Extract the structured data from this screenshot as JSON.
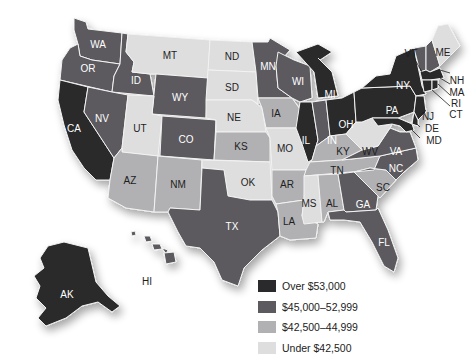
{
  "legend": {
    "items": [
      {
        "label": "Over $53,000",
        "color": "#2a2a2c"
      },
      {
        "label": "$45,000–52,999",
        "color": "#5c5a5e"
      },
      {
        "label": "$42,500–44,999",
        "color": "#b1b1b3"
      },
      {
        "label": "Under $42,500",
        "color": "#dedede"
      }
    ]
  },
  "states": {
    "WA": {
      "label": "WA",
      "tier": 2
    },
    "OR": {
      "label": "OR",
      "tier": 2
    },
    "CA": {
      "label": "CA",
      "tier": 1
    },
    "ID": {
      "label": "ID",
      "tier": 2
    },
    "NV": {
      "label": "NV",
      "tier": 2
    },
    "MT": {
      "label": "MT",
      "tier": 4
    },
    "WY": {
      "label": "WY",
      "tier": 2
    },
    "UT": {
      "label": "UT",
      "tier": 4
    },
    "AZ": {
      "label": "AZ",
      "tier": 3
    },
    "CO": {
      "label": "CO",
      "tier": 2
    },
    "NM": {
      "label": "NM",
      "tier": 3
    },
    "ND": {
      "label": "ND",
      "tier": 4
    },
    "SD": {
      "label": "SD",
      "tier": 4
    },
    "NE": {
      "label": "NE",
      "tier": 4
    },
    "KS": {
      "label": "KS",
      "tier": 3
    },
    "OK": {
      "label": "OK",
      "tier": 4
    },
    "TX": {
      "label": "TX",
      "tier": 2
    },
    "MN": {
      "label": "MN",
      "tier": 2
    },
    "IA": {
      "label": "IA",
      "tier": 3
    },
    "MO": {
      "label": "MO",
      "tier": 4
    },
    "AR": {
      "label": "AR",
      "tier": 3
    },
    "LA": {
      "label": "LA",
      "tier": 3
    },
    "WI": {
      "label": "WI",
      "tier": 2
    },
    "IL": {
      "label": "IL",
      "tier": 1
    },
    "MI": {
      "label": "MI",
      "tier": 1
    },
    "IN": {
      "label": "IN",
      "tier": 2
    },
    "OH": {
      "label": "OH",
      "tier": 1
    },
    "KY": {
      "label": "KY",
      "tier": 3
    },
    "TN": {
      "label": "TN",
      "tier": 3
    },
    "MS": {
      "label": "MS",
      "tier": 4
    },
    "AL": {
      "label": "AL",
      "tier": 3
    },
    "GA": {
      "label": "GA",
      "tier": 2
    },
    "FL": {
      "label": "FL",
      "tier": 2
    },
    "SC": {
      "label": "SC",
      "tier": 3
    },
    "NC": {
      "label": "NC",
      "tier": 2
    },
    "VA": {
      "label": "VA",
      "tier": 2
    },
    "WV": {
      "label": "WV",
      "tier": 4
    },
    "PA": {
      "label": "PA",
      "tier": 1
    },
    "NY": {
      "label": "NY",
      "tier": 1
    },
    "VT": {
      "label": "VT",
      "tier": 2
    },
    "NH": {
      "label": "NH",
      "tier": 2
    },
    "ME": {
      "label": "ME",
      "tier": 4
    },
    "MA": {
      "label": "MA",
      "tier": 1
    },
    "RI": {
      "label": "RI",
      "tier": 1
    },
    "CT": {
      "label": "CT",
      "tier": 1
    },
    "NJ": {
      "label": "NJ",
      "tier": 1
    },
    "DE": {
      "label": "DE",
      "tier": 1
    },
    "MD": {
      "label": "MD",
      "tier": 1
    },
    "AK": {
      "label": "AK",
      "tier": 1
    },
    "HI": {
      "label": "HI",
      "tier": 2
    }
  }
}
